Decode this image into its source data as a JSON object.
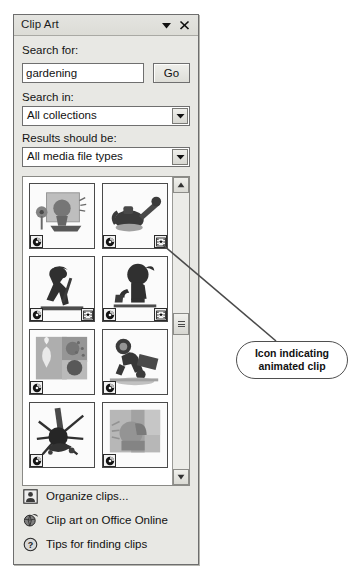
{
  "panel": {
    "title": "Clip Art",
    "dropdown_icon": "chevron-down-icon",
    "close_icon": "close-icon"
  },
  "search": {
    "label": "Search for:",
    "value": "gardening",
    "placeholder": "",
    "go_label": "Go"
  },
  "search_in": {
    "label": "Search in:",
    "value": "All collections",
    "arrow_icon": "chevron-down-icon"
  },
  "results_should_be": {
    "label": "Results should be:",
    "value": "All media file types",
    "arrow_icon": "chevron-down-icon"
  },
  "results": {
    "scrollbar": {
      "up_icon": "scroll-up-arrow-icon",
      "down_icon": "scroll-down-arrow-icon",
      "thumb_icon": "scrollbar-thumb-grip-icon"
    },
    "thumbnails": [
      {
        "name": "gardening-tools-clip",
        "cd_badge": "cd-badge-icon",
        "animated_badge": null
      },
      {
        "name": "watering-can-clip",
        "cd_badge": "cd-badge-icon",
        "animated_badge": "animated-clip-badge-icon"
      },
      {
        "name": "gardener-digging-clip",
        "cd_badge": "cd-badge-icon",
        "animated_badge": "animated-clip-badge-icon"
      },
      {
        "name": "child-watering-clip",
        "cd_badge": "cd-badge-icon",
        "animated_badge": "animated-clip-badge-icon"
      },
      {
        "name": "garden-collage-clip",
        "cd_badge": "cd-badge-icon",
        "animated_badge": null
      },
      {
        "name": "person-wheelbarrow-clip",
        "cd_badge": "cd-badge-icon",
        "animated_badge": null
      },
      {
        "name": "garden-rake-clip",
        "cd_badge": "cd-badge-icon",
        "animated_badge": null
      },
      {
        "name": "watering-pot-clip",
        "cd_badge": "cd-badge-icon",
        "animated_badge": null
      }
    ]
  },
  "links": [
    {
      "icon": "organize-clips-icon",
      "label": "Organize clips..."
    },
    {
      "icon": "office-online-globe-icon",
      "label": "Clip art on Office Online"
    },
    {
      "icon": "help-question-icon",
      "label": "Tips for finding clips"
    }
  ],
  "annotation": {
    "line1": "Icon indicating",
    "line2": "animated clip"
  }
}
